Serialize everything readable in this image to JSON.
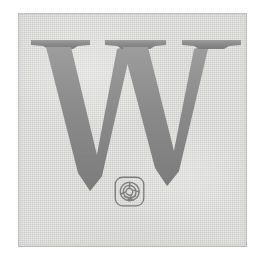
{
  "page": {
    "kind": "scanned-book-decoration",
    "background_color": "#ffffff",
    "width": 271,
    "height": 265
  },
  "panel": {
    "name": "decorative-panel",
    "background_color": "#e1e1e0",
    "edge_color": "#afafaf",
    "left": 18,
    "top": 13,
    "width": 229,
    "height": 234
  },
  "initial": {
    "letter": "W",
    "description": "large serif capital W drop cap",
    "ink_color": "#8a8a8a",
    "ink_color_light": "#9d9d9d",
    "ink_color_dark": "#7c7c7c"
  },
  "emblem": {
    "name": "rose-monogram-emblem",
    "description": "rounded square containing a rose spiral monogram",
    "ink_color": "#7e7e7e",
    "size": 33
  },
  "alt_text": "Decorative drop capital letter W on a grey panel, with a small rose emblem beneath"
}
